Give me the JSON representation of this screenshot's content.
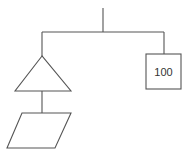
{
  "diagram": {
    "type": "hanging-mobile",
    "stroke_color": "#555555",
    "background": "#ffffff",
    "top_string": {
      "x": 103,
      "y1": 8,
      "y2": 32
    },
    "beam": {
      "x1": 42,
      "x2": 164,
      "y": 32
    },
    "left_arm": {
      "string": {
        "x": 42,
        "y1": 32,
        "y2": 56
      },
      "triangle": {
        "apex": [
          42,
          56
        ],
        "base_left": [
          15,
          91
        ],
        "base_right": [
          71,
          91
        ]
      },
      "connector": {
        "x": 42,
        "y1": 91,
        "y2": 113
      },
      "parallelogram": {
        "points": [
          [
            22,
            113
          ],
          [
            71,
            113
          ],
          [
            55,
            148
          ],
          [
            7,
            148
          ]
        ]
      }
    },
    "right_arm": {
      "string": {
        "x": 164,
        "y1": 32,
        "y2": 54
      },
      "box": {
        "x": 146,
        "y": 54,
        "width": 35,
        "height": 35,
        "label": "100"
      }
    }
  }
}
